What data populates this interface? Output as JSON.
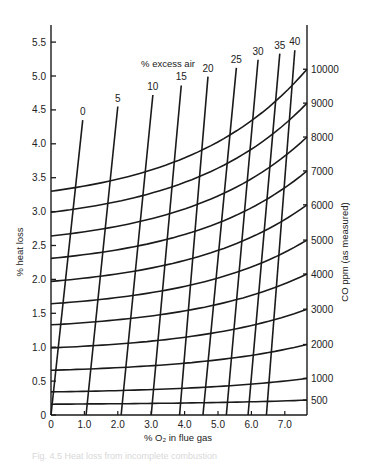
{
  "chart_data": {
    "type": "line",
    "title": "",
    "xlabel": "% O₂ in flue gas",
    "ylabel": "% heat loss",
    "y2label": "CO ppm (as measured)",
    "family_label": "% excess air",
    "xlim": [
      0,
      7.6
    ],
    "ylim": [
      0,
      5.7
    ],
    "grid": false,
    "legend": "none",
    "x_ticks": [
      "0",
      "1.0",
      "2.0",
      "3.0",
      "4.0",
      "5.0",
      "6.0",
      "7.0"
    ],
    "y_ticks": [
      "0",
      "0.5",
      "1.0",
      "1.5",
      "2.0",
      "2.5",
      "3.0",
      "3.5",
      "4.0",
      "4.5",
      "5.0",
      "5.5"
    ],
    "co_ppm_curves": [
      {
        "name": "10000",
        "x": [
          0,
          7.6
        ],
        "y_start": 3.3,
        "y_end": 5.1
      },
      {
        "name": "9000",
        "x": [
          0,
          7.6
        ],
        "y_start": 2.99,
        "y_end": 4.6
      },
      {
        "name": "8000",
        "x": [
          0,
          7.6
        ],
        "y_start": 2.64,
        "y_end": 4.1
      },
      {
        "name": "7000",
        "x": [
          0,
          7.6
        ],
        "y_start": 2.31,
        "y_end": 3.6
      },
      {
        "name": "6000",
        "x": [
          0,
          7.6
        ],
        "y_start": 1.97,
        "y_end": 3.1
      },
      {
        "name": "5000",
        "x": [
          0,
          7.6
        ],
        "y_start": 1.64,
        "y_end": 2.58
      },
      {
        "name": "4000",
        "x": [
          0,
          7.6
        ],
        "y_start": 1.33,
        "y_end": 2.08
      },
      {
        "name": "3000",
        "x": [
          0,
          7.6
        ],
        "y_start": 0.99,
        "y_end": 1.56
      },
      {
        "name": "2000",
        "x": [
          0,
          7.6
        ],
        "y_start": 0.66,
        "y_end": 1.04
      },
      {
        "name": "1000",
        "x": [
          0,
          7.6
        ],
        "y_start": 0.34,
        "y_end": 0.54
      },
      {
        "name": "500",
        "x": [
          0,
          7.6
        ],
        "y_start": 0.16,
        "y_end": 0.22
      }
    ],
    "excess_air_lines": [
      {
        "name": "0",
        "x_bottom": 0.0,
        "x_top": 0.95,
        "y_top": 4.35
      },
      {
        "name": "5",
        "x_bottom": 1.05,
        "x_top": 2.0,
        "y_top": 4.55
      },
      {
        "name": "10",
        "x_bottom": 2.1,
        "x_top": 3.05,
        "y_top": 4.72
      },
      {
        "name": "15",
        "x_bottom": 3.0,
        "x_top": 3.9,
        "y_top": 4.86
      },
      {
        "name": "20",
        "x_bottom": 3.85,
        "x_top": 4.7,
        "y_top": 4.99
      },
      {
        "name": "25",
        "x_bottom": 4.55,
        "x_top": 5.55,
        "y_top": 5.12
      },
      {
        "name": "30",
        "x_bottom": 5.25,
        "x_top": 6.2,
        "y_top": 5.24
      },
      {
        "name": "35",
        "x_bottom": 5.9,
        "x_top": 6.85,
        "y_top": 5.33
      },
      {
        "name": "40",
        "x_bottom": 6.45,
        "x_top": 7.3,
        "y_top": 5.38
      }
    ],
    "right_axis_ticks": [
      "500",
      "1000",
      "2000",
      "3000",
      "4000",
      "5000",
      "6000",
      "7000",
      "8000",
      "9000",
      "10000"
    ]
  },
  "caption": "Fig. 4.5 Heat loss from incomplete combustion"
}
